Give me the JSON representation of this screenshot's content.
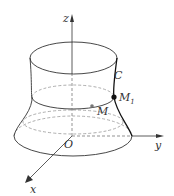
{
  "diagram": {
    "type": "surface-of-revolution",
    "axes": {
      "x": "x",
      "y": "y",
      "z": "z",
      "origin": "O"
    },
    "curve_label": "C",
    "points": {
      "M": "M",
      "M1": "M",
      "M1_sub": "1"
    },
    "colors": {
      "stroke": "#333333",
      "dashed": "#888888",
      "point": "#111111",
      "point_m": "#777777"
    }
  }
}
